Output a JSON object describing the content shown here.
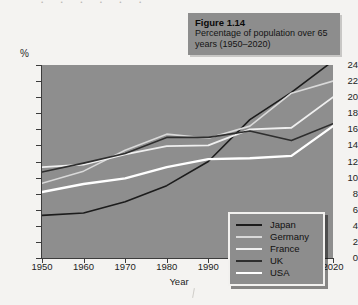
{
  "page": {
    "cropped_header_text": "· · · · · ·"
  },
  "caption": {
    "figure_label": "Figure 1.14",
    "description": "Percentage of population over 65 years (1950–2020)"
  },
  "axes": {
    "y_unit": "%",
    "x_title": "Year"
  },
  "colors": {
    "plot_background": "#8e8e8e",
    "caption_background": "#8d8d8d",
    "legend_background": "#8d8d8d",
    "japan": "#1c1c1c",
    "germany": "#d9d9d9",
    "france": "#efefef",
    "uk": "#2e2e2e",
    "usa": "#ffffff"
  },
  "chart_data": {
    "type": "line",
    "title": "Percentage of population over 65 years (1950–2020)",
    "xlabel": "Year",
    "ylabel": "%",
    "xlim": [
      1950,
      2020
    ],
    "ylim": [
      0,
      24
    ],
    "ytick_step": 2,
    "grid": false,
    "legend_position": "inside-bottom-right",
    "x": [
      1950,
      1960,
      1970,
      1980,
      1990,
      2000,
      2010,
      2020
    ],
    "categories": [
      "1950",
      "1960",
      "1970",
      "1980",
      "1990",
      "2000",
      "2010",
      "2020"
    ],
    "yticks": [
      0,
      2,
      4,
      6,
      8,
      10,
      12,
      14,
      16,
      18,
      20,
      22,
      24
    ],
    "series": [
      {
        "name": "Japan",
        "values": [
          5.3,
          5.6,
          7.0,
          9.0,
          12.0,
          17.2,
          20.6,
          24.5
        ]
      },
      {
        "name": "Germany",
        "values": [
          9.3,
          10.8,
          13.4,
          15.4,
          14.9,
          16.4,
          20.5,
          22.0
        ]
      },
      {
        "name": "France",
        "values": [
          11.3,
          11.6,
          12.9,
          13.9,
          14.0,
          16.0,
          16.2,
          20.0
        ]
      },
      {
        "name": "UK",
        "values": [
          10.7,
          11.8,
          13.0,
          15.0,
          15.0,
          15.8,
          14.6,
          16.7
        ]
      },
      {
        "name": "USA",
        "values": [
          8.2,
          9.2,
          9.9,
          11.3,
          12.3,
          12.4,
          12.7,
          16.4
        ]
      }
    ]
  },
  "legend": {
    "items": [
      {
        "label": "Japan",
        "color": "#1c1c1c",
        "width": 1.6
      },
      {
        "label": "Germany",
        "color": "#d9d9d9",
        "width": 1.6
      },
      {
        "label": "France",
        "color": "#efefef",
        "width": 1.8
      },
      {
        "label": "UK",
        "color": "#2e2e2e",
        "width": 1.6
      },
      {
        "label": "USA",
        "color": "#ffffff",
        "width": 2.4
      }
    ]
  }
}
